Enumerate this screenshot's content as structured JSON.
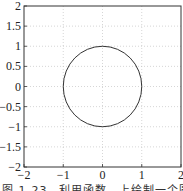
{
  "chart_data": {
    "type": "line",
    "title": "",
    "xlabel": "",
    "ylabel": "",
    "xlim": [
      -2,
      2
    ],
    "ylim": [
      -2,
      2
    ],
    "grid": true,
    "x_ticks": [
      "-2",
      "-1",
      "0",
      "1",
      "2"
    ],
    "y_ticks": [
      "2",
      "1.5",
      "1",
      "0.5",
      "0",
      "-0.5",
      "-1",
      "-1.5",
      "-2"
    ],
    "series": [
      {
        "name": "unit circle",
        "shape": "circle",
        "center": [
          0,
          0
        ],
        "radius": 1,
        "color": "#333333"
      }
    ]
  },
  "caption": "图 1-23　利用函数　上绘制一个圆"
}
